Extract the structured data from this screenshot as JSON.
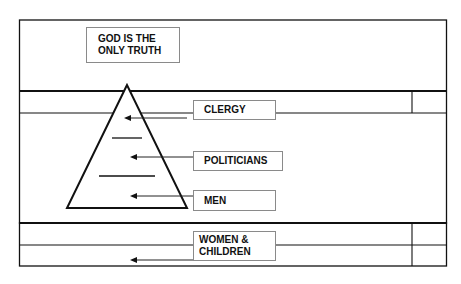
{
  "diagram": {
    "title_box": "GOD IS THE\nONLY TRUTH",
    "labels": [
      {
        "id": "clergy",
        "text": "CLERGY"
      },
      {
        "id": "politicians",
        "text": "POLITICIANS"
      },
      {
        "id": "men",
        "text": "MEN"
      },
      {
        "id": "women-children",
        "text": "WOMEN &\nCHILDREN"
      }
    ],
    "structure": {
      "shape": "pyramid",
      "levels": [
        "CLERGY",
        "POLITICIANS",
        "MEN"
      ],
      "outside_pyramid": "WOMEN & CHILDREN",
      "apex_label": "GOD IS THE ONLY TRUTH"
    },
    "colors": {
      "line": "#111111",
      "box_border": "#8a8a8a",
      "background": "#ffffff"
    }
  }
}
